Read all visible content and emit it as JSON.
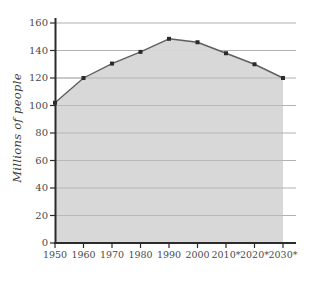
{
  "chart_data": {
    "type": "area",
    "title": "",
    "subtitle": "",
    "xlabel": "",
    "ylabel": "Millions of people",
    "categories": [
      "1950",
      "1960",
      "1970",
      "1980",
      "1990",
      "2000",
      "2010*",
      "2020*",
      "2030*"
    ],
    "values": [
      102,
      120,
      130.5,
      139,
      148.5,
      146,
      138,
      130,
      120
    ],
    "x_tick_labels": [
      "1950",
      "1960",
      "1970",
      "1980",
      "1990",
      "2000",
      "2010*",
      "2020*",
      "2030*"
    ],
    "y_tick_labels": [
      "0",
      "20",
      "40",
      "60",
      "80",
      "100",
      "120",
      "140",
      "160"
    ],
    "y_tick_values": [
      0,
      20,
      40,
      60,
      80,
      100,
      120,
      140,
      160
    ],
    "ylim": [
      0,
      160
    ],
    "grid": "horizontal",
    "legend": "none",
    "marker": "square",
    "series": [
      {
        "name": "Millions of people",
        "values": [
          102,
          120,
          130.5,
          139,
          148.5,
          146,
          138,
          130,
          120
        ]
      }
    ],
    "colors": {
      "fill": "#d6d6d6",
      "line": "#595959",
      "marker": "#2b2b2b",
      "grid": "#9a9a9a",
      "axis": "#2b2b2b",
      "text": "#4a4a4a",
      "background": "#ffffff"
    }
  }
}
